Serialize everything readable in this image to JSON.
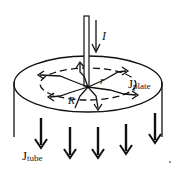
{
  "diagram": {
    "labels": {
      "current": "I",
      "radius_small": "r",
      "radius_large": "R",
      "j_plate_main": "J",
      "j_plate_sub": "plate",
      "j_tube_main": "J",
      "j_tube_sub": "tube"
    },
    "colors": {
      "stroke": "#111111",
      "background": "#ffffff"
    }
  }
}
